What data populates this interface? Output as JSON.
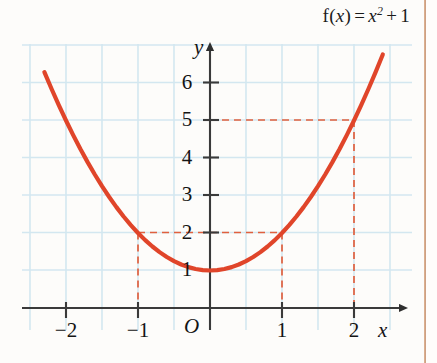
{
  "figure": {
    "formula": {
      "function_name": "f",
      "argument": "x",
      "equals": "=",
      "expression_base": "x",
      "exponent": "2",
      "plus": "+",
      "constant": "1",
      "full_text": "f(x) = x² + 1"
    },
    "axis_labels": {
      "x": "x",
      "y": "y",
      "origin": "O"
    },
    "colors": {
      "curve": "#e0452a",
      "dashed": "#e0603f",
      "grid": "#d3e7f0",
      "axis": "#3a3a3a",
      "background": "#fdfcfa",
      "page_edge": "#c8875a",
      "text": "#141414"
    }
  },
  "chart_data": {
    "type": "line",
    "xlabel": "x",
    "ylabel": "y",
    "function": "y = x^2 + 1",
    "xlim": [
      -2.4,
      2.6
    ],
    "ylim": [
      -0.5,
      7.0
    ],
    "xticks": [
      -2,
      -1,
      1,
      2
    ],
    "xtick_labels": [
      "−2",
      "−1",
      "1",
      "2"
    ],
    "yticks": [
      1,
      2,
      3,
      4,
      5,
      6
    ],
    "ytick_labels": [
      "1",
      "2",
      "3",
      "4",
      "5",
      "6"
    ],
    "grid": true,
    "grid_spacing_x": 0.5,
    "grid_spacing_y": 1,
    "legend": null,
    "x": [
      -2.3,
      -2.2,
      -2.1,
      -2.0,
      -1.9,
      -1.8,
      -1.7,
      -1.6,
      -1.5,
      -1.4,
      -1.3,
      -1.2,
      -1.1,
      -1.0,
      -0.9,
      -0.8,
      -0.7,
      -0.6,
      -0.5,
      -0.4,
      -0.3,
      -0.2,
      -0.1,
      0.0,
      0.1,
      0.2,
      0.3,
      0.4,
      0.5,
      0.6,
      0.7,
      0.8,
      0.9,
      1.0,
      1.1,
      1.2,
      1.3,
      1.4,
      1.5,
      1.6,
      1.7,
      1.8,
      1.9,
      2.0,
      2.1,
      2.2,
      2.3,
      2.4
    ],
    "y": [
      6.29,
      5.84,
      5.41,
      5.0,
      4.61,
      4.24,
      3.89,
      3.56,
      3.25,
      2.96,
      2.69,
      2.44,
      2.21,
      2.0,
      1.81,
      1.64,
      1.49,
      1.36,
      1.25,
      1.16,
      1.09,
      1.04,
      1.01,
      1.0,
      1.01,
      1.04,
      1.09,
      1.16,
      1.25,
      1.36,
      1.49,
      1.64,
      1.81,
      2.0,
      2.21,
      2.44,
      2.69,
      2.96,
      3.25,
      3.56,
      3.89,
      4.24,
      4.61,
      5.0,
      5.41,
      5.84,
      6.29,
      6.76
    ],
    "annotations": [
      {
        "name": "guide-x-minus1",
        "type": "dashed-vertical",
        "x": -1,
        "y_from": 0,
        "y_to": 2
      },
      {
        "name": "guide-x-1",
        "type": "dashed-vertical",
        "x": 1,
        "y_from": 0,
        "y_to": 2
      },
      {
        "name": "guide-x-2",
        "type": "dashed-vertical",
        "x": 2,
        "y_from": 0,
        "y_to": 5
      },
      {
        "name": "guide-y-2",
        "type": "dashed-horizontal",
        "y": 2,
        "x_from": -1,
        "x_to": 1
      },
      {
        "name": "guide-y-5",
        "type": "dashed-horizontal",
        "y": 5,
        "x_from": 0,
        "x_to": 2
      }
    ],
    "key_points": [
      {
        "x": -1,
        "y": 2
      },
      {
        "x": 0,
        "y": 1
      },
      {
        "x": 1,
        "y": 2
      },
      {
        "x": 2,
        "y": 5
      }
    ]
  }
}
